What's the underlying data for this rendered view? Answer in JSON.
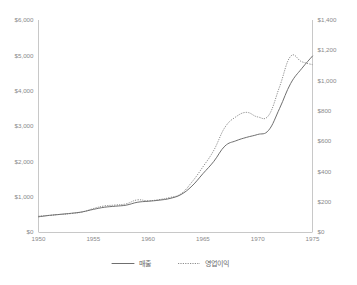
{
  "chart_data": {
    "type": "line",
    "title": "",
    "xlabel": "",
    "ylabel": "",
    "grid": false,
    "legend_position": "bottom",
    "x": [
      1950,
      1951,
      1952,
      1953,
      1954,
      1955,
      1956,
      1957,
      1958,
      1959,
      1960,
      1961,
      1962,
      1963,
      1964,
      1965,
      1966,
      1967,
      1968,
      1969,
      1970,
      1971,
      1972,
      1973,
      1974,
      1975
    ],
    "x_axis": {
      "ticks": [
        1950,
        1955,
        1960,
        1965,
        1970,
        1975
      ],
      "tick_labels": [
        "1950",
        "1955",
        "1960",
        "1965",
        "1970",
        "1975"
      ],
      "min": 1950,
      "max": 1975
    },
    "y_axis_left": {
      "ticks": [
        0,
        1000,
        2000,
        3000,
        4000,
        5000,
        6000
      ],
      "tick_labels": [
        "$0",
        "$1,000",
        "$2,000",
        "$3,000",
        "$4,000",
        "$5,000",
        "$6,000"
      ],
      "min": 0,
      "max": 6000
    },
    "y_axis_right": {
      "ticks": [
        0,
        200,
        400,
        600,
        800,
        1000,
        1200,
        1400
      ],
      "tick_labels": [
        "$0",
        "$200",
        "$400",
        "$600",
        "$800",
        "$1,000",
        "$1,200",
        "$1,400"
      ],
      "min": 0,
      "max": 1400
    },
    "series": [
      {
        "name": "매출",
        "axis": "left",
        "style": "solid",
        "color": "#6f6f6f",
        "values": [
          430,
          470,
          500,
          530,
          570,
          640,
          700,
          730,
          760,
          840,
          870,
          900,
          950,
          1060,
          1300,
          1650,
          2000,
          2430,
          2580,
          2680,
          2760,
          2880,
          3500,
          4200,
          4620,
          4980
        ]
      },
      {
        "name": "영업이익",
        "axis": "right",
        "style": "dotted",
        "color": "#8d8d8d",
        "values": [
          105,
          110,
          116,
          122,
          132,
          155,
          172,
          178,
          186,
          212,
          206,
          214,
          228,
          252,
          330,
          430,
          540,
          690,
          760,
          790,
          760,
          770,
          960,
          1160,
          1125,
          1105
        ]
      }
    ]
  },
  "legend": {
    "items": [
      {
        "label": "매출",
        "style": "solid"
      },
      {
        "label": "영업이익",
        "style": "dotted"
      }
    ]
  }
}
